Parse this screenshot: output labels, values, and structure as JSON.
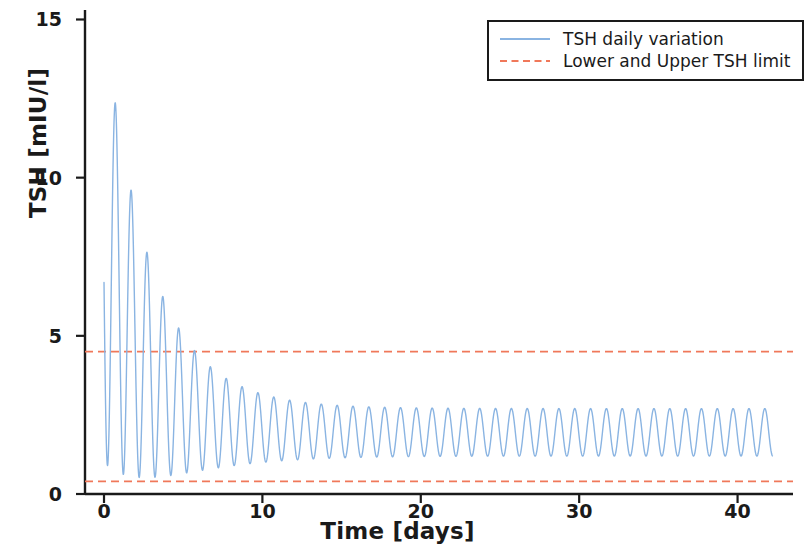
{
  "chart_data": {
    "type": "line",
    "title": "",
    "xlabel": "Time [days]",
    "ylabel": "TSH [mIU/l]",
    "xlim": [
      -1.2,
      43.5
    ],
    "ylim": [
      0,
      15.3
    ],
    "xticks": [
      0,
      10,
      20,
      30,
      40
    ],
    "xtick_labels": [
      "0",
      "10",
      "20",
      "30",
      "40"
    ],
    "yticks": [
      0,
      5,
      10,
      15
    ],
    "ytick_labels": [
      "0",
      "5",
      "10",
      "15"
    ],
    "grid": false,
    "legend_position": "upper right",
    "series": [
      {
        "name": "TSH daily variation",
        "color": "#8ab4e2",
        "linestyle": "solid",
        "linewidth": 1.4,
        "description": "Damped daily oscillation of TSH starting near 10 mIU/l, peaking at 14.9 on day 0.7, decaying to a steady daily cycle between 1.2 and 2.7 mIU/l",
        "model": {
          "baseline_start": 8.0,
          "baseline_final": 1.95,
          "baseline_decay_days": 2.6,
          "amplitude_start": 7.0,
          "amplitude_final": 0.75,
          "amplitude_decay_days": 3.4,
          "period_days": 1.0,
          "phase_days": 0.72,
          "t_start": 0,
          "t_end": 42.2,
          "samples": 3400
        },
        "peaks": [
          {
            "t": 0.72,
            "value": 14.9
          },
          {
            "t": 1.72,
            "value": 9.35
          },
          {
            "t": 2.72,
            "value": 6.1
          },
          {
            "t": 3.72,
            "value": 4.55
          },
          {
            "t": 4.72,
            "value": 3.75
          },
          {
            "t": 5.72,
            "value": 3.35
          },
          {
            "t": 6.72,
            "value": 3.1
          },
          {
            "t": 7.72,
            "value": 2.95
          },
          {
            "t": 8.72,
            "value": 2.85
          },
          {
            "t": 10.72,
            "value": 2.75
          },
          {
            "t": 15.72,
            "value": 2.7
          },
          {
            "t": 25.72,
            "value": 2.7
          },
          {
            "t": 35.72,
            "value": 2.7
          },
          {
            "t": 41.72,
            "value": 2.7
          }
        ],
        "troughs": [
          {
            "t": 0.0,
            "value": 10.0
          },
          {
            "t": 1.22,
            "value": 5.95
          },
          {
            "t": 2.22,
            "value": 2.95
          },
          {
            "t": 3.22,
            "value": 1.85
          },
          {
            "t": 4.22,
            "value": 1.5
          },
          {
            "t": 5.22,
            "value": 1.35
          },
          {
            "t": 6.22,
            "value": 1.28
          },
          {
            "t": 8.22,
            "value": 1.22
          },
          {
            "t": 12.22,
            "value": 1.2
          },
          {
            "t": 20.22,
            "value": 1.2
          },
          {
            "t": 30.22,
            "value": 1.2
          },
          {
            "t": 41.22,
            "value": 1.2
          }
        ]
      },
      {
        "name": "Lower and Upper TSH limit",
        "color": "#f0785a",
        "linestyle": "dashed",
        "linewidth": 1.8,
        "type": "hlines",
        "values": [
          0.4,
          4.5
        ],
        "lower_limit": 0.4,
        "upper_limit": 4.5
      }
    ]
  },
  "legend": {
    "items": [
      {
        "label": "TSH daily variation",
        "color": "#8ab4e2",
        "style": "solid"
      },
      {
        "label": "Lower and Upper TSH limit",
        "color": "#f0785a",
        "style": "dashed"
      }
    ]
  },
  "axes": {
    "x_label": "Time [days]",
    "y_label": "TSH [mIU/l]",
    "x_tick_labels": [
      "0",
      "10",
      "20",
      "30",
      "40"
    ],
    "y_tick_labels": [
      "0",
      "5",
      "10",
      "15"
    ]
  },
  "colors": {
    "series_blue": "#8ab4e2",
    "limit_orange": "#f0785a",
    "axis_black": "#1a1a1a",
    "background": "#ffffff"
  }
}
